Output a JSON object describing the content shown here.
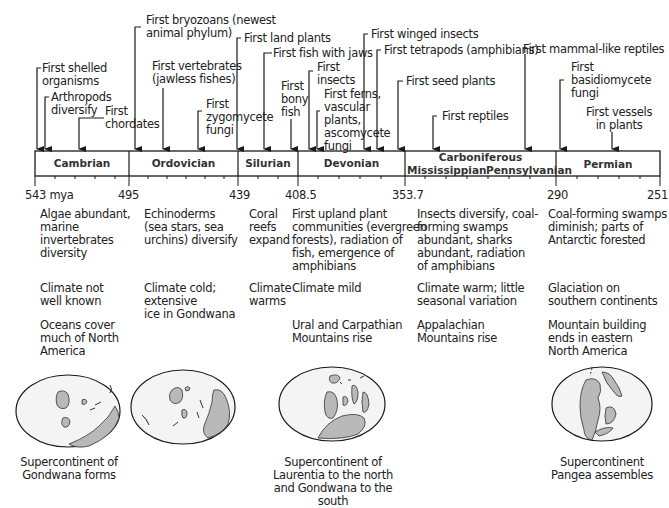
{
  "timeline": {
    "unit": "mya",
    "boundaries": [
      {
        "value": "543 mya",
        "x": 35
      },
      {
        "value": "495",
        "x": 129
      },
      {
        "value": "439",
        "x": 238
      },
      {
        "value": "408.5",
        "x": 298
      },
      {
        "value": "353.7",
        "x": 405
      },
      {
        "value": "290",
        "x": 556
      },
      {
        "value": "251",
        "x": 660
      }
    ],
    "periods": [
      {
        "name": "Cambrian"
      },
      {
        "name": "Ordovician"
      },
      {
        "name": "Silurian"
      },
      {
        "name": "Devonian"
      },
      {
        "name": "Carboniferous",
        "subperiods": [
          "Mississippian",
          "Pennsylvanian"
        ]
      },
      {
        "name": "Permian"
      }
    ]
  },
  "events": [
    {
      "label": "First shelled organisms",
      "lines": [
        "First shelled",
        "organisms"
      ]
    },
    {
      "label": "Arthropods diversify",
      "lines": [
        "Arthropods",
        "diversify"
      ]
    },
    {
      "label": "First chordates",
      "lines": [
        "First",
        "chordates"
      ]
    },
    {
      "label": "First bryozoans (newest animal phylum)",
      "lines": [
        "First bryozoans (newest",
        "animal phylum)"
      ]
    },
    {
      "label": "First vertebrates (jawless fishes)",
      "lines": [
        "First vertebrates",
        "(jawless fishes)"
      ]
    },
    {
      "label": "First zygomycete fungi",
      "lines": [
        "First",
        "zygomycete",
        "fungi"
      ]
    },
    {
      "label": "First land plants",
      "lines": [
        "First land plants"
      ]
    },
    {
      "label": "First fish with jaws",
      "lines": [
        "First fish with jaws"
      ]
    },
    {
      "label": "First bony fish",
      "lines": [
        "First",
        "bony",
        "fish"
      ]
    },
    {
      "label": "First insects",
      "lines": [
        "First",
        "insects"
      ]
    },
    {
      "label": "First ferns, vascular plants, ascomycete fungi",
      "lines": [
        "First ferns,",
        "vascular",
        "plants,",
        "ascomycete",
        "fungi"
      ]
    },
    {
      "label": "First winged insects",
      "lines": [
        "First winged insects"
      ]
    },
    {
      "label": "First tetrapods (amphibians)",
      "lines": [
        "First tetrapods (amphibians)"
      ]
    },
    {
      "label": "First seed plants",
      "lines": [
        "First seed plants"
      ]
    },
    {
      "label": "First reptiles",
      "lines": [
        "First reptiles"
      ]
    },
    {
      "label": "First mammal-like reptiles",
      "lines": [
        "First mammal-like reptiles"
      ]
    },
    {
      "label": "First basidiomycete fungi",
      "lines": [
        "First",
        "basidiomycete",
        "fungi"
      ]
    },
    {
      "label": "First vessels in plants",
      "lines": [
        "First vessels",
        "in plants"
      ]
    }
  ],
  "descriptions": {
    "cambrian": {
      "life": [
        "Algae abundant,",
        "marine",
        "invertebrates",
        "diversity"
      ],
      "climate": [
        "Climate not",
        "well known"
      ],
      "geology": [
        "Oceans cover",
        "much of North",
        "America"
      ]
    },
    "ordovician": {
      "life": [
        "Echinoderms",
        "(sea stars, sea",
        "urchins) diversify"
      ],
      "climate": [
        "Climate cold;",
        "extensive",
        "ice in Gondwana"
      ]
    },
    "silurian": {
      "life": [
        "Coral",
        "reefs",
        "expand"
      ],
      "climate": [
        "Climate",
        "warms"
      ]
    },
    "devonian": {
      "life": [
        "First upland plant",
        "communities (evergreen",
        "forests), radiation of",
        "fish, emergence of",
        "amphibians"
      ],
      "climate": [
        "Climate mild"
      ],
      "geology": [
        "Ural and Carpathian",
        "Mountains rise"
      ]
    },
    "carboniferous": {
      "life": [
        "Insects diversify, coal-",
        "forming swamps",
        "abundant, sharks",
        "abundant, radiation",
        "of amphibians"
      ],
      "climate": [
        "Climate warm; little",
        "seasonal variation"
      ],
      "geology": [
        "Appalachian",
        "Mountains rise"
      ]
    },
    "permian": {
      "life": [
        "Coal-forming swamps",
        "diminish; parts of",
        "Antarctic forested"
      ],
      "climate": [
        "Glaciation on",
        "southern continents"
      ],
      "geology": [
        "Mountain building",
        "ends in eastern",
        "North America"
      ]
    }
  },
  "maps": [
    {
      "caption": [
        "Supercontinent of",
        "Gondwana forms"
      ]
    },
    {
      "caption": []
    },
    {
      "caption": [
        "Supercontinent of",
        "Laurentia to the north",
        "and Gondwana to the south"
      ]
    },
    {
      "caption": [
        "Supercontinent",
        "Pangea assembles"
      ]
    }
  ],
  "colors": {
    "line": "#1a1a1a",
    "land": "#b9b9b9",
    "ocean": "#f4f4f4",
    "text": "#222222"
  }
}
